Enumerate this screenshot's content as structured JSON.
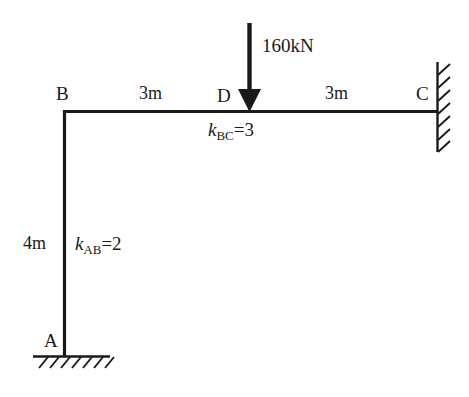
{
  "diagram": {
    "type": "structural-frame",
    "nodes": [
      {
        "id": "A",
        "label": "A",
        "x": 63,
        "y": 355,
        "support": "fixed"
      },
      {
        "id": "B",
        "label": "B",
        "x": 63,
        "y": 110,
        "support": "none"
      },
      {
        "id": "D",
        "label": "D",
        "x": 250,
        "y": 110,
        "support": "none"
      },
      {
        "id": "C",
        "label": "C",
        "x": 437,
        "y": 110,
        "support": "fixed"
      }
    ],
    "members": [
      {
        "id": "AB",
        "from": "A",
        "to": "B",
        "orientation": "vertical"
      },
      {
        "id": "BD",
        "from": "B",
        "to": "D",
        "orientation": "horizontal"
      },
      {
        "id": "DC",
        "from": "D",
        "to": "C",
        "orientation": "horizontal"
      }
    ],
    "dimensions": [
      {
        "id": "BD-span",
        "label": "3m",
        "value": 3,
        "unit": "m"
      },
      {
        "id": "DC-span",
        "label": "3m",
        "value": 3,
        "unit": "m"
      },
      {
        "id": "AB-height",
        "label": "4m",
        "value": 4,
        "unit": "m"
      }
    ],
    "load": {
      "label": "160kN",
      "magnitude": 160,
      "unit": "kN",
      "direction": "down",
      "applied_at": "D"
    },
    "stiffness": [
      {
        "id": "k-BC",
        "symbol": "k",
        "subscript": "BC",
        "equals": "=",
        "value": "3"
      },
      {
        "id": "k-AB",
        "symbol": "k",
        "subscript": "AB",
        "equals": "=",
        "value": "2"
      }
    ],
    "colors": {
      "line": "#1a1a1a",
      "background": "#ffffff",
      "text": "#1a1a1a"
    }
  }
}
